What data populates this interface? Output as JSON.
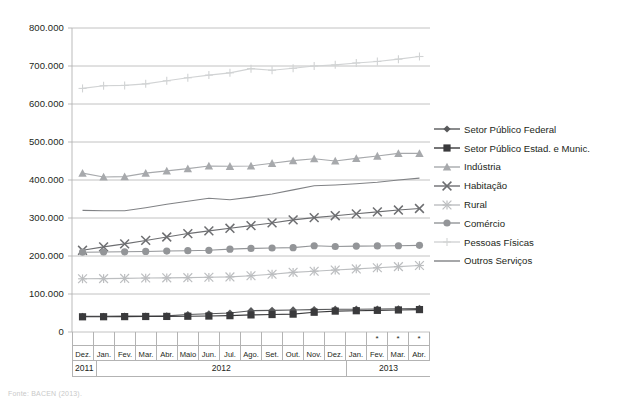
{
  "chart_data": {
    "type": "line",
    "title": "",
    "subtitle": "",
    "xlabel": "",
    "ylabel": "",
    "ylim": [
      0,
      800000
    ],
    "ytick_labels": [
      "800.000",
      "700.000",
      "600.000",
      "500.000",
      "400.000",
      "300.000",
      "200.000",
      "100.000",
      "0"
    ],
    "ytick_values": [
      800000,
      700000,
      600000,
      500000,
      400000,
      300000,
      200000,
      100000,
      0
    ],
    "grid": true,
    "legend_position": "right",
    "x": [
      "Dez.",
      "Jan.",
      "Fev.",
      "Mar.",
      "Abr.",
      "Maio",
      "Jun.",
      "Jul.",
      "Ago.",
      "Set.",
      "Out.",
      "Nov.",
      "Dez.",
      "Jan.",
      "Fev.",
      "Mar.",
      "Abr."
    ],
    "x_provisional_flags": [
      false,
      false,
      false,
      false,
      false,
      false,
      false,
      false,
      false,
      false,
      false,
      false,
      false,
      false,
      true,
      true,
      true
    ],
    "provisional_marker": "*",
    "year_groups": [
      {
        "label": "2011",
        "span": 1,
        "align": "left"
      },
      {
        "label": "2012",
        "span": 12,
        "align": "center"
      },
      {
        "label": "2013",
        "span": 4,
        "align": "center"
      }
    ],
    "series": [
      {
        "name": "Setor Público Federal",
        "marker": "diamond",
        "color": "#58595b",
        "values": [
          41000,
          41500,
          41800,
          42000,
          42500,
          46000,
          48000,
          50000,
          56000,
          57000,
          58000,
          59000,
          60000,
          60000,
          60500,
          61000,
          62000
        ]
      },
      {
        "name": "Setor Público Estad. e Munic.",
        "marker": "square",
        "color": "#3a3a3c",
        "values": [
          40000,
          40200,
          40500,
          40800,
          41000,
          41500,
          42000,
          43000,
          45000,
          46000,
          47000,
          52000,
          55000,
          56000,
          57000,
          58000,
          59000
        ]
      },
      {
        "name": "Indústria",
        "marker": "triangle",
        "color": "#a7a9ac",
        "values": [
          418000,
          408000,
          409000,
          418000,
          424000,
          430000,
          437000,
          436000,
          437000,
          444000,
          451000,
          456000,
          450000,
          457000,
          463000,
          470000,
          470000
        ]
      },
      {
        "name": "Habitação",
        "marker": "x",
        "color": "#6d6e71",
        "values": [
          215000,
          224000,
          232000,
          241000,
          250000,
          259000,
          266000,
          273000,
          280000,
          287000,
          295000,
          301000,
          306000,
          311000,
          316000,
          321000,
          325000
        ]
      },
      {
        "name": "Rural",
        "marker": "asterisk",
        "color": "#bcbec0",
        "values": [
          140000,
          140500,
          141000,
          142000,
          142500,
          143000,
          144000,
          145000,
          148000,
          152000,
          157000,
          160000,
          163000,
          166000,
          169000,
          172000,
          175000
        ]
      },
      {
        "name": "Comércio",
        "marker": "circle",
        "color": "#939598",
        "values": [
          210000,
          210500,
          211000,
          212000,
          213000,
          214000,
          215000,
          218000,
          220000,
          221000,
          222000,
          227000,
          225000,
          226000,
          226500,
          227000,
          228000
        ]
      },
      {
        "name": "Pessoas Físicas",
        "marker": "plus",
        "color": "#d1d3d4",
        "values": [
          641000,
          648000,
          649000,
          653000,
          661000,
          669000,
          676000,
          682000,
          693000,
          689000,
          694000,
          700000,
          703000,
          708000,
          712000,
          718000,
          725000
        ]
      },
      {
        "name": "Outros Serviços",
        "marker": "none",
        "color": "#808285",
        "values": [
          320000,
          319000,
          319000,
          327000,
          336000,
          344000,
          352000,
          348000,
          355000,
          363000,
          374000,
          385000,
          387000,
          390000,
          394000,
          400000,
          405000
        ]
      }
    ]
  },
  "caption": {
    "text": "Fonte: BACEN (2013)."
  }
}
